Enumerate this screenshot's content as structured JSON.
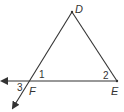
{
  "diagram": {
    "type": "geometry-triangle",
    "points": {
      "D": {
        "label": "D",
        "x": 72,
        "y": 12
      },
      "E": {
        "label": "E",
        "x": 117,
        "y": 81
      },
      "F": {
        "label": "F",
        "x": 30,
        "y": 81
      }
    },
    "angles": {
      "a1": {
        "label": "1"
      },
      "a2": {
        "label": "2"
      },
      "a3": {
        "label": "3"
      }
    },
    "colors": {
      "stroke": "#333333",
      "background": "#ffffff"
    }
  }
}
